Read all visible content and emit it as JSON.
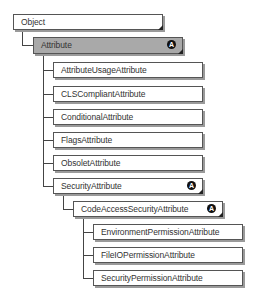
{
  "diagram": {
    "abstract_badge": "A",
    "nodes": [
      {
        "id": "object",
        "label": "Object",
        "level": 0,
        "abstract": false
      },
      {
        "id": "attribute",
        "label": "Attribute",
        "level": 1,
        "abstract": true,
        "highlighted": true
      },
      {
        "id": "attribute-usage",
        "label": "AttributeUsageAttribute",
        "level": 2,
        "abstract": false
      },
      {
        "id": "cls-compliant",
        "label": "CLSCompliantAttribute",
        "level": 2,
        "abstract": false
      },
      {
        "id": "conditional",
        "label": "ConditionalAttribute",
        "level": 2,
        "abstract": false
      },
      {
        "id": "flags",
        "label": "FlagsAttribute",
        "level": 2,
        "abstract": false
      },
      {
        "id": "obsolete",
        "label": "ObsoletAttribute",
        "level": 2,
        "abstract": false
      },
      {
        "id": "security",
        "label": "SecurityAttribute",
        "level": 2,
        "abstract": true
      },
      {
        "id": "code-access-security",
        "label": "CodeAccessSecurityAttribute",
        "level": 3,
        "abstract": true
      },
      {
        "id": "environment-permission",
        "label": "EnvironmentPermissionAttribute",
        "level": 4,
        "abstract": false
      },
      {
        "id": "fileio-permission",
        "label": "FileIOPermissionAttribute",
        "level": 4,
        "abstract": false
      },
      {
        "id": "security-permission",
        "label": "SecurityPermissionAttribute",
        "level": 4,
        "abstract": false
      }
    ]
  }
}
